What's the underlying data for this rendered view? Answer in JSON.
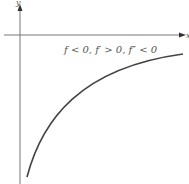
{
  "axes": {
    "x_label": "x",
    "y_label": "y"
  },
  "annotation": "f < 0, f′ > 0, f″ < 0",
  "colors": {
    "axis": "#666666",
    "curve": "#444444",
    "text": "#555555"
  }
}
